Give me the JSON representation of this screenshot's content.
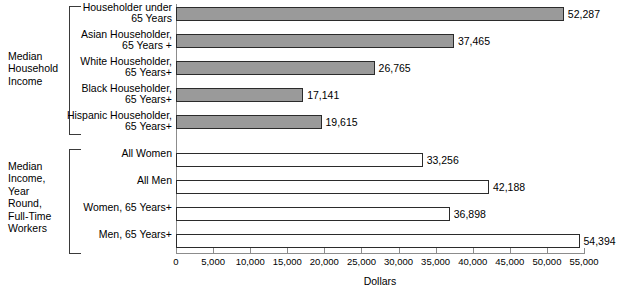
{
  "chart_data": {
    "type": "bar",
    "title": "",
    "xlabel": "Dollars",
    "ylabel": "",
    "orientation": "horizontal",
    "xlim": [
      0,
      55000
    ],
    "xticks": [
      0,
      5000,
      10000,
      15000,
      20000,
      25000,
      30000,
      35000,
      40000,
      45000,
      50000,
      55000
    ],
    "xtick_labels": [
      "0",
      "5,000",
      "10,000",
      "15,000",
      "20,000",
      "25,000",
      "30,000",
      "35,000",
      "40,000",
      "45,000",
      "50,000",
      "55,000"
    ],
    "grid": false,
    "legend": "none",
    "groups": [
      {
        "name": "Median Household Income",
        "label_lines": "Median\nHousehold\nIncome",
        "style": "filled",
        "fill_color": "#9a9a9a",
        "categories": [
          "Householder under\n65 Years",
          "Asian Householder,\n65 Years +",
          "White Householder,\n65 Years+",
          "Black Householder,\n65 Years+",
          "Hispanic Householder,\n65 Years+"
        ],
        "values": [
          52287,
          37465,
          26765,
          17141,
          19615
        ],
        "value_labels": [
          "52,287",
          "37,465",
          "26,765",
          "17,141",
          "19,615"
        ]
      },
      {
        "name": "Median Income, Year Round, Full-Time Workers",
        "label_lines": "Median\nIncome,\nYear\nRound,\nFull-Time\nWorkers",
        "style": "hollow",
        "fill_color": "#ffffff",
        "categories": [
          "All Women",
          "All Men",
          "Women, 65 Years+",
          "Men, 65 Years+"
        ],
        "values": [
          33256,
          42188,
          36898,
          54394
        ],
        "value_labels": [
          "33,256",
          "42,188",
          "36,898",
          "54,394"
        ]
      }
    ]
  },
  "colors": {
    "bar_fill": "#9a9a9a",
    "bar_stroke": "#2b2b2b",
    "axis": "#8c8c8c",
    "text": "#000000",
    "background": "#ffffff"
  }
}
